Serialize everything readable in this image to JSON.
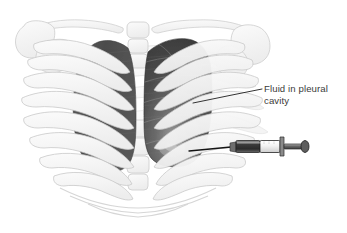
{
  "figure": {
    "background_color": "#ffffff",
    "width": 347,
    "height": 233
  },
  "callout": {
    "label": "Fluid in pleural\ncavity",
    "line1": "Fluid in pleural",
    "line2": "cavity",
    "text_color": "#3b3b3b",
    "leader_line_color": "#1d1d1d"
  },
  "anatomy": {
    "skeleton": {
      "name": "rib-cage",
      "outline_color": "#c9c9c9",
      "fill_color": "#f4f4f4",
      "parts": [
        {
          "name": "clavicle-left",
          "label": "Clavicle"
        },
        {
          "name": "clavicle-right",
          "label": "Clavicle"
        },
        {
          "name": "scapula-left",
          "label": "Scapula"
        },
        {
          "name": "scapula-right",
          "label": "Scapula"
        },
        {
          "name": "sternum",
          "label": "Sternum"
        },
        {
          "name": "ribs",
          "label": "Ribs"
        },
        {
          "name": "costal-cartilage",
          "label": "Costal cartilage"
        }
      ]
    },
    "lung_right": {
      "name": "right-lung",
      "label": "Right lung",
      "fill_color": "#4f4f4f",
      "shaded": true
    },
    "lung_left": {
      "name": "left-lung-pleural-effusion",
      "label": "Left pleural cavity with fluid",
      "fill_color": "#4a4a4a",
      "highlight_color": "#8e8e8e",
      "shaded": true
    }
  },
  "syringe": {
    "name": "syringe",
    "label": "Syringe",
    "needle_color": "#141414",
    "barrel_fluid_color": "#3f3f3f",
    "barrel_empty_color": "#fbfbfb",
    "body_outline_color": "#2a2a2a",
    "plunger_color": "#5a5a5a",
    "parts": [
      {
        "name": "needle",
        "label": "Needle"
      },
      {
        "name": "barrel",
        "label": "Barrel"
      },
      {
        "name": "plunger",
        "label": "Plunger"
      },
      {
        "name": "thumb-rest",
        "label": "Thumb rest"
      }
    ]
  }
}
